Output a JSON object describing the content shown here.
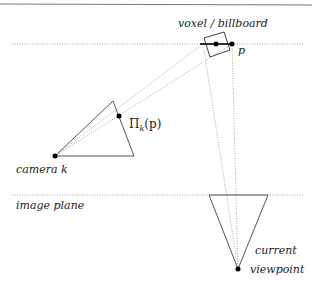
{
  "diagram": {
    "labels": {
      "voxel": "voxel / billboard",
      "p": "p",
      "projection": "Πk(p)",
      "projection_base": "Π",
      "projection_sub": "k",
      "projection_arg": "(p)",
      "camera": "camera k",
      "image_plane": "image plane",
      "current": "current",
      "viewpoint": "viewpoint"
    },
    "colors": {
      "line": "#555555",
      "dotted": "#aaaaaa",
      "point": "#000000",
      "border": "#777777"
    },
    "nodes": {
      "p": {
        "x": 232,
        "y": 44
      },
      "voxel_center_point": {
        "x": 216,
        "y": 44
      },
      "camera_k": {
        "x": 55,
        "y": 156
      },
      "projection_point": {
        "x": 119,
        "y": 116
      },
      "current_viewpoint": {
        "x": 238,
        "y": 269
      }
    }
  }
}
